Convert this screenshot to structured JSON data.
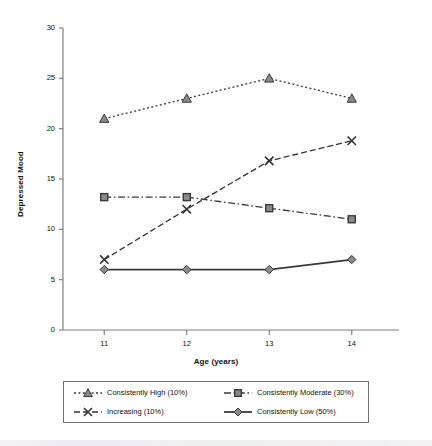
{
  "chart_data": {
    "type": "line",
    "title": "",
    "xlabel": "Age (years)",
    "ylabel": "Depressed Mood",
    "x": [
      11,
      12,
      13,
      14
    ],
    "xticklabels": [
      "11",
      "12",
      "13",
      "14"
    ],
    "xlim": [
      10.5,
      14.5
    ],
    "ylim": [
      0,
      30
    ],
    "yticks": [
      0,
      5,
      10,
      15,
      20,
      25,
      30
    ],
    "yticklabels": [
      "0",
      "5",
      "10",
      "15",
      "20",
      "25",
      "30"
    ],
    "grid": false,
    "legend_position": "bottom",
    "series": [
      {
        "name": "Consistently High (10%)",
        "values": [
          21,
          23,
          25,
          23
        ],
        "marker": "triangle",
        "linestyle": "dotted",
        "color": "#8a8a8a",
        "edgecolor": "#3a3a3a"
      },
      {
        "name": "Increasing (10%)",
        "values": [
          7,
          12,
          16.8,
          18.8
        ],
        "marker": "x",
        "linestyle": "dashed",
        "color": "#555555",
        "edgecolor": "#333333"
      },
      {
        "name": "Consistently Moderate (30%)",
        "values": [
          13.2,
          13.2,
          12.1,
          11
        ],
        "marker": "square",
        "linestyle": "dashdot",
        "color": "#8a8a8a",
        "edgecolor": "#3a3a3a"
      },
      {
        "name": "Consistently Low (50%)",
        "values": [
          6,
          6,
          6,
          7
        ],
        "marker": "diamond",
        "linestyle": "solid",
        "color": "#8a8a8a",
        "edgecolor": "#3a3a3a"
      }
    ]
  },
  "legend": {
    "items": [
      {
        "label": "Consistently High (10%)",
        "marker": "triangle",
        "linestyle": "dotted"
      },
      {
        "label": "Consistently Moderate (30%)",
        "marker": "square",
        "linestyle": "dashdot"
      },
      {
        "label": "Increasing (10%)",
        "marker": "x",
        "linestyle": "dashed"
      },
      {
        "label": "Consistently Low (50%)",
        "marker": "diamond",
        "linestyle": "solid"
      }
    ]
  },
  "axis_color": "#808080",
  "text_color": "#111111"
}
